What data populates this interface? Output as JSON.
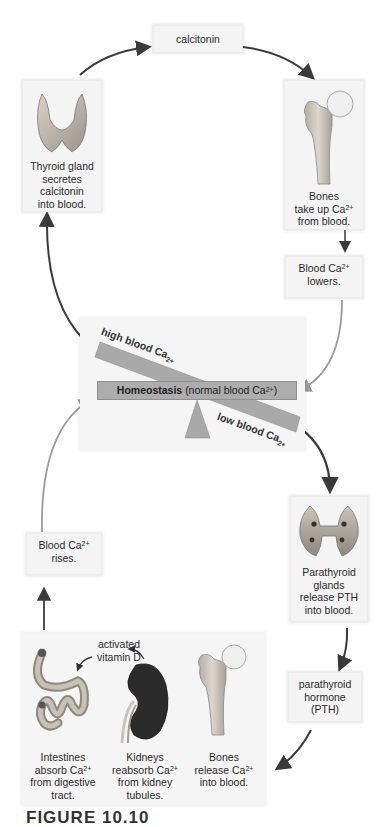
{
  "diagram": {
    "title_caption": "FIGURE 10.10",
    "center": {
      "label_bold": "Homeostasis",
      "label_rest": "(normal blood Ca",
      "label_sup": "2+",
      "label_end": ")",
      "high_label": "high blood Ca",
      "high_sup": "2+",
      "low_label": "low blood Ca",
      "low_sup": "2+"
    },
    "top_loop": {
      "hormone": "calcitonin",
      "thyroid": {
        "lines": [
          "Thyroid gland",
          "secretes",
          "calcitonin",
          "into blood."
        ],
        "icon": "thyroid-gland-icon"
      },
      "bones": {
        "line1": "Bones",
        "line2": "take up Ca",
        "sup": "2+",
        "line3": "from blood.",
        "icon": "femur-bone-icon"
      },
      "result": {
        "line1": "Blood Ca",
        "sup": "2+",
        "line2": "lowers."
      }
    },
    "bottom_loop": {
      "parathyroid": {
        "lines": [
          "Parathyroid",
          "glands",
          "release PTH",
          "into blood."
        ],
        "icon": "parathyroid-glands-icon"
      },
      "hormone": {
        "lines": [
          "parathyroid",
          "hormone",
          "(PTH)"
        ]
      },
      "vitamin_d": {
        "lines": [
          "activated",
          "vitamin D"
        ]
      },
      "intestines": {
        "line1": "Intestines",
        "line2": "absorb Ca",
        "sup": "2+",
        "line3": "from digestive",
        "line4": "tract.",
        "icon": "intestines-icon"
      },
      "kidneys": {
        "line1": "Kidneys",
        "line2": "reabsorb Ca",
        "sup": "2+",
        "line3": "from kidney",
        "line4": "tubules.",
        "icon": "kidney-icon"
      },
      "bones": {
        "line1": "Bones",
        "line2": "release Ca",
        "sup": "2+",
        "line3": "into blood.",
        "icon": "femur-bone-icon"
      },
      "result": {
        "line1": "Blood Ca",
        "sup": "2+",
        "line2": "rises."
      }
    },
    "colors": {
      "arrow_dark": "#3a3a3a",
      "arrow_light": "#9a9a9a",
      "seesaw_bar": "#a9a9a9",
      "box_bg": "#f4f4f4",
      "kidney": "#2b2b2b"
    }
  }
}
